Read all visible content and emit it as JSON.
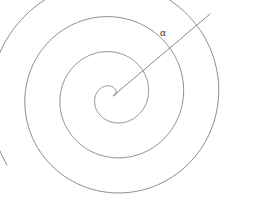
{
  "figure": {
    "type": "archimedean-spiral-diagram",
    "background_color": "#ffffff",
    "stroke_color": "#6b6b6b",
    "label_color": "#333333",
    "width": 259,
    "height": 220,
    "center": {
      "x": 113,
      "y": 96
    },
    "spiral": {
      "name": "archimedean-spiral",
      "equation": "r = a + b*theta",
      "a": 1.5,
      "b": 5.6,
      "turns": 3.55,
      "theta_start_deg": 0,
      "theta_end_deg": 1278,
      "start_angle_offset_deg": 15,
      "direction": "clockwise-outward",
      "outer_end_point": {
        "x": 243,
        "y": 133
      },
      "extents": {
        "left_x": 13,
        "top_y": 17,
        "bottom_y": 206,
        "right_x": 243
      }
    },
    "ray": {
      "name": "angle-ray",
      "from": {
        "x": 113,
        "y": 96
      },
      "to": {
        "x": 210,
        "y": 14
      },
      "angle_deg": 40,
      "length": 127
    },
    "labels": [
      {
        "id": "alpha",
        "text": "α",
        "x": 160,
        "y": 27,
        "font_size": 11
      }
    ]
  }
}
